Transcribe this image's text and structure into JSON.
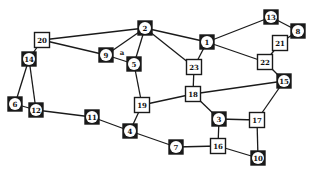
{
  "diagram": {
    "type": "graph",
    "nodes": [
      {
        "id": "1",
        "x": 207,
        "y": 42,
        "style": "round"
      },
      {
        "id": "2",
        "x": 145,
        "y": 28,
        "style": "round"
      },
      {
        "id": "3",
        "x": 219,
        "y": 119,
        "style": "round"
      },
      {
        "id": "4",
        "x": 130,
        "y": 131,
        "style": "round"
      },
      {
        "id": "5",
        "x": 134,
        "y": 64,
        "style": "round"
      },
      {
        "id": "6",
        "x": 15,
        "y": 104,
        "style": "round"
      },
      {
        "id": "7",
        "x": 176,
        "y": 147,
        "style": "round"
      },
      {
        "id": "8",
        "x": 298,
        "y": 31,
        "style": "round"
      },
      {
        "id": "9",
        "x": 106,
        "y": 55,
        "style": "round"
      },
      {
        "id": "10",
        "x": 258,
        "y": 158,
        "style": "round"
      },
      {
        "id": "11",
        "x": 92,
        "y": 117,
        "style": "round"
      },
      {
        "id": "12",
        "x": 36,
        "y": 110,
        "style": "round"
      },
      {
        "id": "13",
        "x": 271,
        "y": 17,
        "style": "round"
      },
      {
        "id": "14",
        "x": 29,
        "y": 59,
        "style": "round"
      },
      {
        "id": "15",
        "x": 284,
        "y": 81,
        "style": "round"
      },
      {
        "id": "16",
        "x": 218,
        "y": 146,
        "style": "square"
      },
      {
        "id": "17",
        "x": 257,
        "y": 120,
        "style": "square"
      },
      {
        "id": "18",
        "x": 193,
        "y": 94,
        "style": "square"
      },
      {
        "id": "19",
        "x": 142,
        "y": 105,
        "style": "square"
      },
      {
        "id": "20",
        "x": 42,
        "y": 40,
        "style": "square"
      },
      {
        "id": "21",
        "x": 280,
        "y": 43,
        "style": "square"
      },
      {
        "id": "22",
        "x": 265,
        "y": 62,
        "style": "square"
      },
      {
        "id": "23",
        "x": 194,
        "y": 67,
        "style": "square"
      }
    ],
    "edges": [
      [
        "20",
        "2"
      ],
      [
        "20",
        "9"
      ],
      [
        "20",
        "14"
      ],
      [
        "2",
        "9"
      ],
      [
        "2",
        "5"
      ],
      [
        "2",
        "1"
      ],
      [
        "2",
        "23"
      ],
      [
        "9",
        "5"
      ],
      [
        "1",
        "13"
      ],
      [
        "1",
        "22"
      ],
      [
        "1",
        "23"
      ],
      [
        "13",
        "8"
      ],
      [
        "8",
        "21"
      ],
      [
        "21",
        "22"
      ],
      [
        "22",
        "15"
      ],
      [
        "14",
        "6"
      ],
      [
        "14",
        "12"
      ],
      [
        "6",
        "12"
      ],
      [
        "12",
        "11"
      ],
      [
        "11",
        "4"
      ],
      [
        "4",
        "19"
      ],
      [
        "4",
        "7"
      ],
      [
        "5",
        "19"
      ],
      [
        "19",
        "18"
      ],
      [
        "23",
        "18"
      ],
      [
        "18",
        "15"
      ],
      [
        "18",
        "3"
      ],
      [
        "3",
        "17"
      ],
      [
        "3",
        "16"
      ],
      [
        "15",
        "17"
      ],
      [
        "17",
        "10"
      ],
      [
        "7",
        "16"
      ],
      [
        "16",
        "10"
      ]
    ],
    "annotations": [
      {
        "text": "a",
        "x": 122,
        "y": 52
      }
    ],
    "colors": {
      "line": "#1a1a1a",
      "background": "#ffffff"
    }
  }
}
